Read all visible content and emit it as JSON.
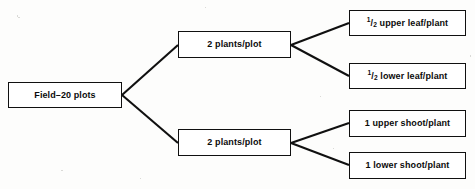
{
  "diagram": {
    "type": "tree",
    "title": "",
    "orientation": "left-to-right",
    "colors": {
      "background": "#fdfdfc",
      "box_fill": "#ffffff",
      "box_border": "#101010",
      "edge": "#101010",
      "text": "#0b0b0b"
    },
    "levels": 3,
    "nodes": {
      "root": {
        "label": "Field–20 plots",
        "level": 1
      },
      "mid": [
        {
          "label": "2 plants/plot",
          "level": 2
        },
        {
          "label": "2 plants/plot",
          "level": 2
        }
      ],
      "leaves": [
        {
          "numerator": "1",
          "denominator": "2",
          "separator": "/",
          "text": " upper leaf/plant",
          "label": "¹/₂ upper leaf/plant",
          "level": 3
        },
        {
          "numerator": "1",
          "denominator": "2",
          "separator": "/",
          "text": " lower leaf/plant",
          "label": "¹/₂ lower leaf/plant",
          "level": 3
        },
        {
          "label": "1 upper shoot/plant",
          "level": 3
        },
        {
          "label": "1 lower shoot/plant",
          "level": 3
        }
      ]
    },
    "edges": [
      {
        "from": "root",
        "to": "mid-1"
      },
      {
        "from": "root",
        "to": "mid-2"
      },
      {
        "from": "mid-1",
        "to": "leaf-1"
      },
      {
        "from": "mid-1",
        "to": "leaf-2"
      },
      {
        "from": "mid-2",
        "to": "leaf-3"
      },
      {
        "from": "mid-2",
        "to": "leaf-4"
      }
    ]
  }
}
